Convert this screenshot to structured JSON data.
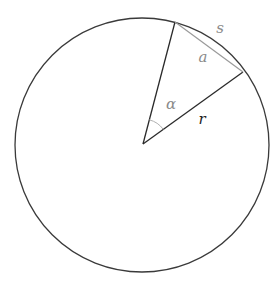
{
  "diagram": {
    "labels": {
      "arc": "s",
      "chord": "a",
      "angle": "α",
      "radius": "r"
    },
    "colors": {
      "circle": "#3a3a3a",
      "radius": "#2a2a2a",
      "chord": "#9a9a9a",
      "angle_arc": "#b0b0b0",
      "label_gray": "#8a8a8a",
      "label_dark": "#222222",
      "background": "#ffffff"
    }
  }
}
